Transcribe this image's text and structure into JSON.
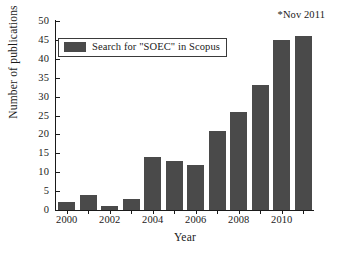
{
  "chart_data": {
    "type": "bar",
    "title": "",
    "xlabel": "Year",
    "ylabel": "Number of publications",
    "categories": [
      "2000",
      "2001",
      "2002",
      "2003",
      "2004",
      "2005",
      "2006",
      "2007",
      "2008",
      "2009",
      "2010",
      "2011"
    ],
    "values": [
      2,
      4,
      1,
      3,
      14,
      13,
      12,
      21,
      26,
      33,
      45,
      46
    ],
    "series": [
      {
        "name": "Search for \"SOEC\" in Scopus",
        "values": [
          2,
          4,
          1,
          3,
          14,
          13,
          12,
          21,
          26,
          33,
          45,
          46
        ],
        "color": "#4a4a4a"
      }
    ],
    "ylim": [
      0,
      50
    ],
    "y_ticks": [
      0,
      5,
      10,
      15,
      20,
      25,
      30,
      35,
      40,
      45,
      50
    ],
    "y_tick_labels": [
      "0",
      "5",
      "10",
      "15",
      "20",
      "25",
      "30",
      "35",
      "40",
      "45",
      "50"
    ],
    "x_tick_labels": [
      "2000",
      "2002",
      "2004",
      "2006",
      "2008",
      "2010"
    ],
    "x_tick_categories": [
      "2000",
      "2002",
      "2004",
      "2006",
      "2008",
      "2010"
    ],
    "grid": false,
    "legend_position": "upper left",
    "annotations": [
      {
        "text": "*Nov 2011",
        "position": "top-right"
      }
    ]
  },
  "legend": {
    "label": "Search for \"SOEC\" in Scopus",
    "swatch_color": "#4a4a4a"
  },
  "annotation": {
    "text": "*Nov 2011"
  },
  "axes": {
    "x_title": "Year",
    "y_title": "Number of publications",
    "axis_color": "#1a1a1a"
  }
}
